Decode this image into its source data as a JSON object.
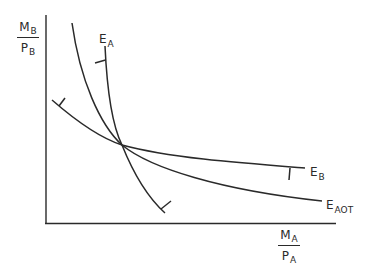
{
  "diagram": {
    "y_axis_label": {
      "numerator": "M",
      "numerator_sub": "B",
      "denominator": "P",
      "denominator_sub": "B"
    },
    "x_axis_label": {
      "numerator": "M",
      "numerator_sub": "A",
      "denominator": "P",
      "denominator_sub": "A"
    },
    "curves": [
      {
        "id": "E_A",
        "label": "E",
        "sub": "A",
        "description": "steep curve with tick marks pointing outward"
      },
      {
        "id": "E_B",
        "label": "E",
        "sub": "B",
        "description": "flat curve with tick marks"
      },
      {
        "id": "E_AOT",
        "label": "E",
        "sub": "AOT",
        "description": "convex curve passing through common intersection"
      }
    ],
    "colors": {
      "line": "#2a2a2a",
      "background": "#ffffff"
    }
  }
}
